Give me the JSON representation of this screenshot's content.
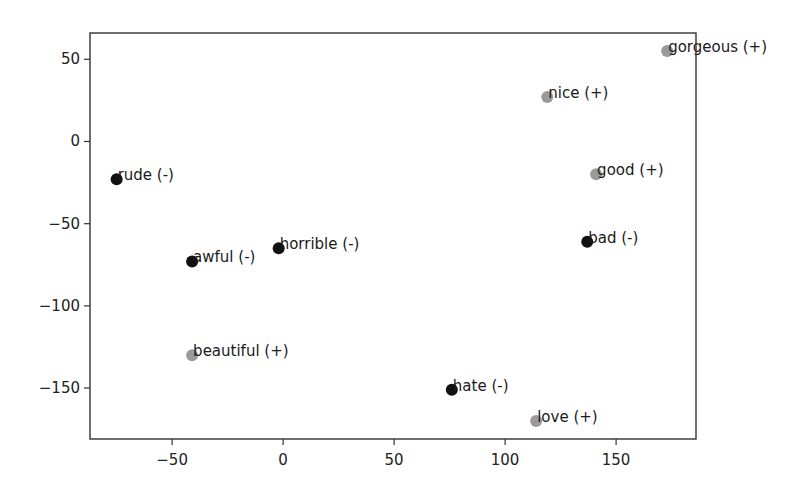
{
  "chart_data": {
    "type": "scatter",
    "title": "",
    "xlabel": "",
    "ylabel": "",
    "xlim": [
      -87,
      186
    ],
    "ylim": [
      -181,
      66
    ],
    "grid": false,
    "legend": null,
    "xticks": [
      -50,
      0,
      50,
      100,
      150
    ],
    "yticks": [
      50,
      0,
      -50,
      -100,
      -150
    ],
    "xtick_labels": [
      "−50",
      "0",
      "50",
      "100",
      "150"
    ],
    "ytick_labels": [
      "50",
      "0",
      "−50",
      "−100",
      "−150"
    ],
    "colors": {
      "positive": "#9a9a9a",
      "negative": "#111111"
    },
    "points": [
      {
        "label": "rude (-)",
        "x": -75,
        "y": -23,
        "sentiment": "negative"
      },
      {
        "label": "awful (-)",
        "x": -41,
        "y": -73,
        "sentiment": "negative"
      },
      {
        "label": "horrible (-)",
        "x": -2,
        "y": -65,
        "sentiment": "negative"
      },
      {
        "label": "beautiful (+)",
        "x": -41,
        "y": -130,
        "sentiment": "positive"
      },
      {
        "label": "hate (-)",
        "x": 76,
        "y": -151,
        "sentiment": "negative"
      },
      {
        "label": "love (+)",
        "x": 114,
        "y": -170,
        "sentiment": "positive"
      },
      {
        "label": "bad (-)",
        "x": 137,
        "y": -61,
        "sentiment": "negative"
      },
      {
        "label": "good (+)",
        "x": 141,
        "y": -20,
        "sentiment": "positive"
      },
      {
        "label": "nice (+)",
        "x": 119,
        "y": 27,
        "sentiment": "positive"
      },
      {
        "label": "gorgeous (+)",
        "x": 173,
        "y": 55,
        "sentiment": "positive"
      }
    ]
  }
}
